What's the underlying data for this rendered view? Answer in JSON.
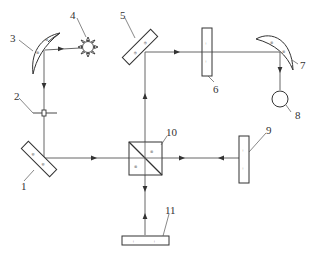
{
  "diagram": {
    "type": "optical-schematic",
    "colors": {
      "line": "#333333",
      "beam": "#444444",
      "background": "#ffffff"
    },
    "components": [
      {
        "id": "1",
        "label": "1",
        "kind": "flat-mirror-45deg"
      },
      {
        "id": "2",
        "label": "2",
        "kind": "aperture"
      },
      {
        "id": "3",
        "label": "3",
        "kind": "concave-mirror"
      },
      {
        "id": "4",
        "label": "4",
        "kind": "light-source"
      },
      {
        "id": "5",
        "label": "5",
        "kind": "flat-mirror-45deg"
      },
      {
        "id": "6",
        "label": "6",
        "kind": "window-or-sample"
      },
      {
        "id": "7",
        "label": "7",
        "kind": "concave-mirror"
      },
      {
        "id": "8",
        "label": "8",
        "kind": "detector"
      },
      {
        "id": "9",
        "label": "9",
        "kind": "fixed-mirror"
      },
      {
        "id": "10",
        "label": "10",
        "kind": "beam-splitter"
      },
      {
        "id": "11",
        "label": "11",
        "kind": "moving-mirror"
      }
    ],
    "beam_path": [
      "4",
      "3",
      "2",
      "1",
      "10",
      "9",
      "11",
      "5",
      "6",
      "7",
      "8"
    ]
  }
}
